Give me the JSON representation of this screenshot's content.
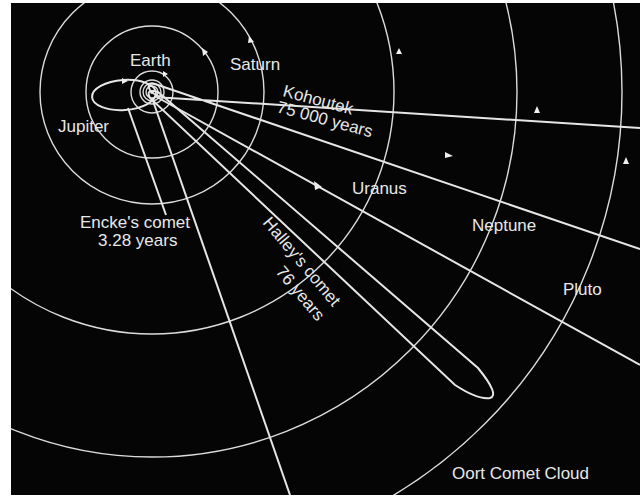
{
  "diagram": {
    "background": "#050505",
    "line_color": "#e0e0e0",
    "planets": [
      {
        "name": "Earth",
        "label": "Earth"
      },
      {
        "name": "Jupiter",
        "label": "Jupiter"
      },
      {
        "name": "Saturn",
        "label": "Saturn"
      },
      {
        "name": "Uranus",
        "label": "Uranus"
      },
      {
        "name": "Neptune",
        "label": "Neptune"
      },
      {
        "name": "Pluto",
        "label": "Pluto"
      }
    ],
    "comets": [
      {
        "name": "Encke's comet",
        "line1": "Encke's comet",
        "line2": "3.28 years"
      },
      {
        "name": "Halley's comet",
        "line1": "Halley's comet",
        "line2": "76 years"
      },
      {
        "name": "Kohoutek",
        "line1": "Kohoutek",
        "line2": "75 000 years"
      }
    ],
    "region_label": "Oort Comet Cloud"
  }
}
